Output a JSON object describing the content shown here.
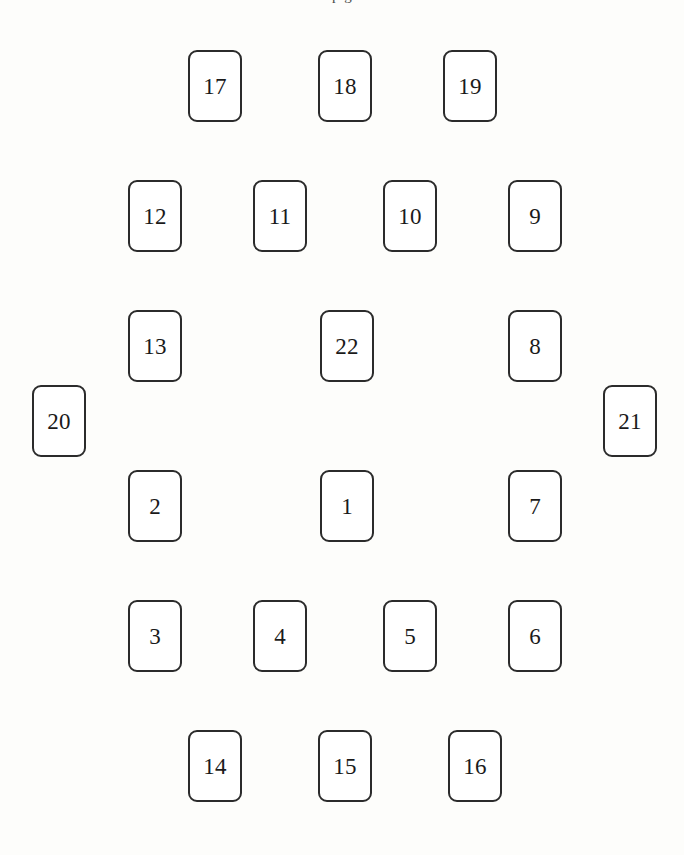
{
  "page": {
    "background_color": "#fdfdfb",
    "width": 684,
    "height": 855,
    "clipped_caption_text": "p g"
  },
  "style": {
    "card_fill": "#ffffff",
    "card_border_color": "#2b2b2b",
    "card_number_color": "#1a1a1a",
    "card_width": 54,
    "card_height": 72,
    "card_corner_radius": 9
  },
  "diagram": {
    "type": "card-spread-layout",
    "shape": "oval-ring",
    "card_count": 22,
    "cards": [
      {
        "number": "17",
        "x": 188,
        "y": 50,
        "row": 1,
        "col": 1
      },
      {
        "number": "18",
        "x": 318,
        "y": 50,
        "row": 1,
        "col": 2
      },
      {
        "number": "19",
        "x": 443,
        "y": 50,
        "row": 1,
        "col": 3
      },
      {
        "number": "12",
        "x": 128,
        "y": 180,
        "row": 2,
        "col": 1
      },
      {
        "number": "11",
        "x": 253,
        "y": 180,
        "row": 2,
        "col": 2
      },
      {
        "number": "10",
        "x": 383,
        "y": 180,
        "row": 2,
        "col": 3
      },
      {
        "number": "9",
        "x": 508,
        "y": 180,
        "row": 2,
        "col": 4
      },
      {
        "number": "13",
        "x": 128,
        "y": 310,
        "row": 3,
        "col": 1
      },
      {
        "number": "22",
        "x": 320,
        "y": 310,
        "row": 3,
        "col": 2
      },
      {
        "number": "8",
        "x": 508,
        "y": 310,
        "row": 3,
        "col": 3
      },
      {
        "number": "20",
        "x": 32,
        "y": 385,
        "row": 4,
        "col": 1
      },
      {
        "number": "21",
        "x": 603,
        "y": 385,
        "row": 4,
        "col": 2
      },
      {
        "number": "2",
        "x": 128,
        "y": 470,
        "row": 5,
        "col": 1
      },
      {
        "number": "1",
        "x": 320,
        "y": 470,
        "row": 5,
        "col": 2
      },
      {
        "number": "7",
        "x": 508,
        "y": 470,
        "row": 5,
        "col": 3
      },
      {
        "number": "3",
        "x": 128,
        "y": 600,
        "row": 6,
        "col": 1
      },
      {
        "number": "4",
        "x": 253,
        "y": 600,
        "row": 6,
        "col": 2
      },
      {
        "number": "5",
        "x": 383,
        "y": 600,
        "row": 6,
        "col": 3
      },
      {
        "number": "6",
        "x": 508,
        "y": 600,
        "row": 6,
        "col": 4
      },
      {
        "number": "14",
        "x": 188,
        "y": 730,
        "row": 7,
        "col": 1
      },
      {
        "number": "15",
        "x": 318,
        "y": 730,
        "row": 7,
        "col": 2
      },
      {
        "number": "16",
        "x": 448,
        "y": 730,
        "row": 7,
        "col": 3
      }
    ]
  }
}
